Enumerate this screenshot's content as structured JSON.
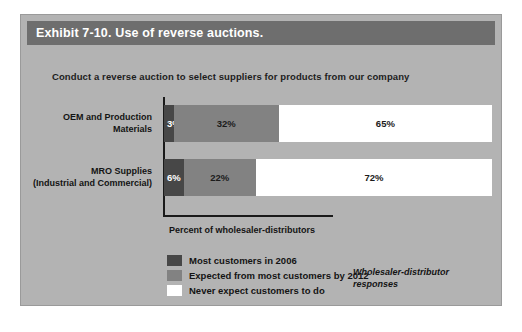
{
  "exhibit": {
    "title": "Exhibit 7-10. Use of reverse auctions.",
    "subtitle": "Conduct a reverse auction to select suppliers for products from our company",
    "annotation": "Wholesaler-distributor responses"
  },
  "colors": {
    "panel_background": "#b3b3b3",
    "title_bar": "#6e6e6e",
    "title_text": "#ffffff",
    "series_dark": "#474747",
    "series_medium": "#828282",
    "series_light": "#ffffff",
    "axis": "#1a1a1a",
    "text": "#141414"
  },
  "chart_data": {
    "type": "bar",
    "orientation": "horizontal",
    "stacked": true,
    "title": "Exhibit 7-10. Use of reverse auctions.",
    "subtitle": "Conduct a reverse auction to select suppliers for products from our company",
    "xlabel": "Percent of wholesaler-distributors",
    "ylabel": "",
    "xlim": [
      0,
      100
    ],
    "grid": false,
    "legend_position": "bottom-left",
    "categories": [
      "OEM and Production Materials",
      "MRO Supplies (Industrial and Commercial)"
    ],
    "category_lines": [
      [
        "OEM and Production",
        "Materials"
      ],
      [
        "MRO Supplies",
        "(Industrial and Commercial)"
      ]
    ],
    "series": [
      {
        "name": "Most customers in 2006",
        "color": "#474747",
        "values": [
          3,
          6
        ],
        "labels": [
          "3%",
          "6%"
        ]
      },
      {
        "name": "Expected from most customers by 2012",
        "color": "#828282",
        "values": [
          32,
          22
        ],
        "labels": [
          "32%",
          "22%"
        ]
      },
      {
        "name": "Never expect customers to do",
        "color": "#ffffff",
        "values": [
          65,
          72
        ],
        "labels": [
          "65%",
          "72%"
        ]
      }
    ]
  }
}
